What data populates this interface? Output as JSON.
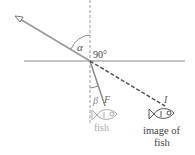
{
  "diagram": {
    "labels": {
      "alpha": "α",
      "right_angle": "90°",
      "beta": "β",
      "fish_point": "F",
      "image_point": "I",
      "fish_caption": "fish",
      "image_caption_line1": "image of",
      "image_caption_line2": "fish"
    },
    "elements": {
      "water_surface": "horizontal line (water surface)",
      "normal": "dashed vertical normal line",
      "incident_ray": "ray from eye to surface",
      "refracted_ray": "ray from surface to fish F",
      "image_ray": "dashed extension to image I"
    },
    "colors": {
      "line": "#9a9a9a",
      "dashed_image_line": "#555555",
      "text": "#444444",
      "fish_faded": "#aaaaaa",
      "fish_image": "#555555"
    }
  }
}
